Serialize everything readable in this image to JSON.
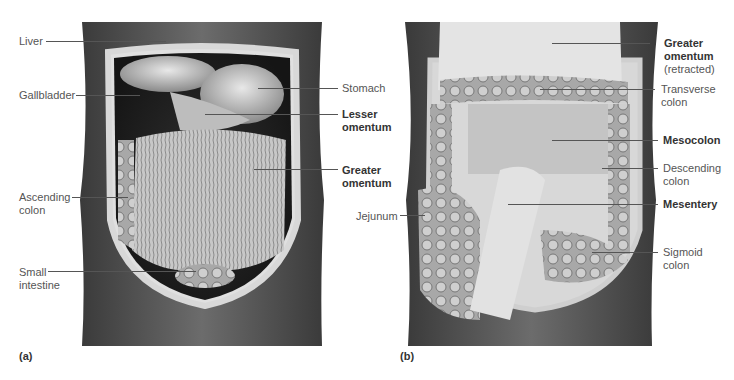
{
  "figure": {
    "panels": [
      {
        "tag": "(a)",
        "labels_left": [
          {
            "text": "Liver",
            "bold": false
          },
          {
            "text": "Gallbladder",
            "bold": false
          },
          {
            "text": "Ascending colon",
            "line1": "Ascending",
            "line2": "colon",
            "bold": false
          },
          {
            "text": "Small intestine",
            "line1": "Small",
            "line2": "intestine",
            "bold": false
          }
        ],
        "labels_right": [
          {
            "text": "Stomach",
            "bold": false
          },
          {
            "text": "Lesser omentum",
            "line1": "Lesser",
            "line2": "omentum",
            "bold": true
          },
          {
            "text": "Greater omentum",
            "line1": "Greater",
            "line2": "omentum",
            "bold": true
          }
        ]
      },
      {
        "tag": "(b)",
        "labels_left": [
          {
            "text": "Jejunum",
            "bold": false
          }
        ],
        "labels_right": [
          {
            "text": "Greater omentum (retracted)",
            "line1": "Greater",
            "line2": "omentum",
            "line3": "(retracted)",
            "bold": true
          },
          {
            "text": "Transverse colon",
            "line1": "Transverse",
            "line2": "colon",
            "bold": false
          },
          {
            "text": "Mesocolon",
            "bold": true
          },
          {
            "text": "Descending colon",
            "line1": "Descending",
            "line2": "colon",
            "bold": false
          },
          {
            "text": "Mesentery",
            "bold": true
          },
          {
            "text": "Sigmoid colon",
            "line1": "Sigmoid",
            "line2": "colon",
            "bold": false
          }
        ]
      }
    ]
  }
}
